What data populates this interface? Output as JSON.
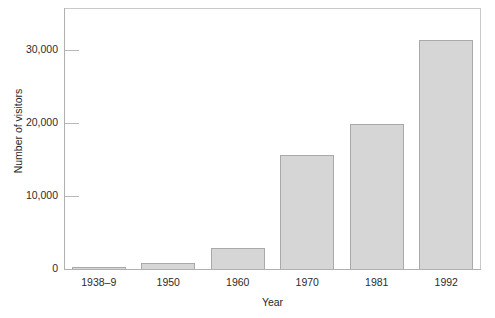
{
  "chart_data": {
    "type": "bar",
    "title": "",
    "xlabel": "Year",
    "ylabel": "Number of visitors",
    "categories": [
      "1938–9",
      "1950",
      "1960",
      "1970",
      "1981",
      "1992"
    ],
    "values": [
      250,
      900,
      3000,
      15800,
      20000,
      31500
    ],
    "ylim": [
      0,
      35500
    ],
    "yticks": [
      0,
      10000,
      20000,
      30000
    ],
    "ytick_labels": [
      "0",
      "10,000",
      "20,000",
      "30,000"
    ],
    "grid": false,
    "legend": null,
    "bar_fill_color": "#d6d6d6",
    "bar_border_color": "#a9a9a9",
    "axis_color": "#b0b0b0",
    "text_color": "#1f1f1f"
  }
}
